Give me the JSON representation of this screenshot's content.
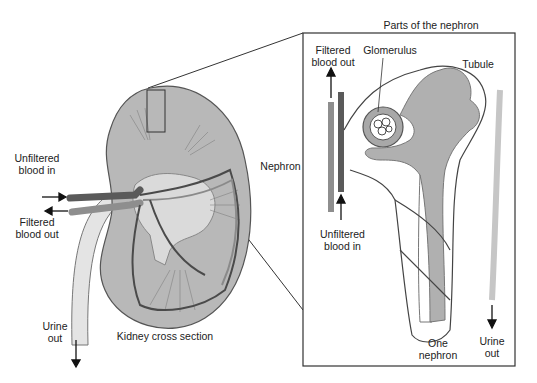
{
  "diagram": {
    "title": "Parts of the nephron",
    "left_panel": {
      "caption": "Kidney cross section",
      "labels": {
        "unfiltered_in_line1": "Unfiltered",
        "unfiltered_in_line2": "blood in",
        "filtered_out_line1": "Filtered",
        "filtered_out_line2": "blood out",
        "urine_out_line1": "Urine",
        "urine_out_line2": "out"
      }
    },
    "side_label": "Nephron",
    "right_panel": {
      "labels": {
        "filtered_out_line1": "Filtered",
        "filtered_out_line2": "blood out",
        "glomerulus": "Glomerulus",
        "tubule": "Tubule",
        "unfiltered_in_line1": "Unfiltered",
        "unfiltered_in_line2": "blood in",
        "one_nephron_line1": "One",
        "one_nephron_line2": "nephron",
        "urine_out_line1": "Urine",
        "urine_out_line2": "out"
      }
    },
    "colors": {
      "kidney_fill": "#b5b5b5",
      "medulla_fill": "#d9d9d9",
      "artery": "#5a5a5a",
      "vein": "#8e8e8e",
      "tubule_fill": "#b0b0b0",
      "outline": "#333333"
    }
  }
}
